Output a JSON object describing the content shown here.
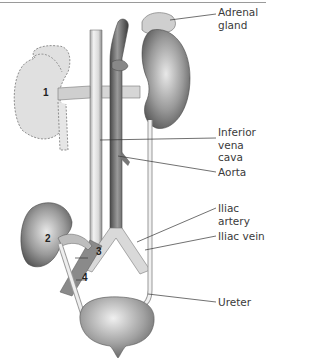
{
  "diagram": {
    "labels": [
      {
        "id": "adrenal-gland",
        "line1": "Adrenal",
        "line2": "gland"
      },
      {
        "id": "inferior-vena-cava",
        "line1": "Inferior",
        "line2": "vena cava"
      },
      {
        "id": "aorta",
        "line1": "Aorta"
      },
      {
        "id": "iliac-artery",
        "line1": "Iliac artery"
      },
      {
        "id": "iliac-vein",
        "line1": "Iliac vein"
      },
      {
        "id": "ureter",
        "line1": "Ureter"
      }
    ],
    "numbers": [
      "1",
      "2",
      "3",
      "4"
    ],
    "colors": {
      "rule": "#9a9a9a",
      "leader": "#333333",
      "text": "#3a3a3a",
      "ghost_kidney": "#e0e0e0",
      "kidney": "#8a8a8a",
      "vessel": "#d8d8d8",
      "aorta": "#6e6e6e"
    }
  }
}
